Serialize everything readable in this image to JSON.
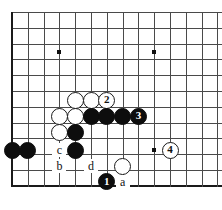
{
  "diagram": {
    "kind": "go-board-problem",
    "board": {
      "grid": {
        "cols": 14,
        "rows": 12,
        "origin_x": 12,
        "origin_y": 12,
        "spacing": 15.8
      },
      "line_color": "#4a4a4a",
      "edge_color": "#1a1a1a",
      "background": "#ffffff",
      "star_points": [
        {
          "col": 3,
          "row": 2.55
        },
        {
          "col": 9,
          "row": 2.55
        },
        {
          "col": 9,
          "row": 8.75
        }
      ]
    },
    "stones": [
      {
        "id": "w-a1",
        "color": "white",
        "label": "",
        "col": 4,
        "row": 5.6
      },
      {
        "id": "w-a2",
        "color": "white",
        "label": "",
        "col": 5,
        "row": 5.6
      },
      {
        "id": "w-move2",
        "color": "white",
        "label": "2",
        "col": 6,
        "row": 5.6
      },
      {
        "id": "w-b1",
        "color": "white",
        "label": "",
        "col": 3,
        "row": 6.6
      },
      {
        "id": "w-b2",
        "color": "white",
        "label": "",
        "col": 4,
        "row": 6.6
      },
      {
        "id": "b-c1",
        "color": "black",
        "label": "",
        "col": 5,
        "row": 6.6
      },
      {
        "id": "b-c2",
        "color": "black",
        "label": "",
        "col": 6,
        "row": 6.6
      },
      {
        "id": "b-c3",
        "color": "black",
        "label": "",
        "col": 7,
        "row": 6.6
      },
      {
        "id": "b-move3",
        "color": "black",
        "label": "3",
        "col": 8,
        "row": 6.6
      },
      {
        "id": "w-d1",
        "color": "white",
        "label": "",
        "col": 3,
        "row": 7.6
      },
      {
        "id": "b-d2",
        "color": "black",
        "label": "",
        "col": 4,
        "row": 7.6
      },
      {
        "id": "b-e1",
        "color": "black",
        "label": "",
        "col": 0,
        "row": 8.75
      },
      {
        "id": "b-e2",
        "color": "black",
        "label": "",
        "col": 1,
        "row": 8.75
      },
      {
        "id": "b-e3",
        "color": "black",
        "label": "",
        "col": 4,
        "row": 8.75
      },
      {
        "id": "w-move4",
        "color": "white",
        "label": "4",
        "col": 10,
        "row": 8.75
      },
      {
        "id": "w-f1",
        "color": "white",
        "label": "",
        "col": 7,
        "row": 9.75
      },
      {
        "id": "b-move1",
        "color": "black",
        "label": "1",
        "col": 6,
        "row": 10.75
      }
    ],
    "point_labels": [
      {
        "id": "label-c",
        "text": "c",
        "col": 3,
        "row": 8.75
      },
      {
        "id": "label-b",
        "text": "b",
        "col": 3,
        "row": 9.75
      },
      {
        "id": "label-d",
        "text": "d",
        "col": 5,
        "row": 9.75
      },
      {
        "id": "label-a",
        "text": "a",
        "col": 7,
        "row": 10.75
      }
    ]
  }
}
